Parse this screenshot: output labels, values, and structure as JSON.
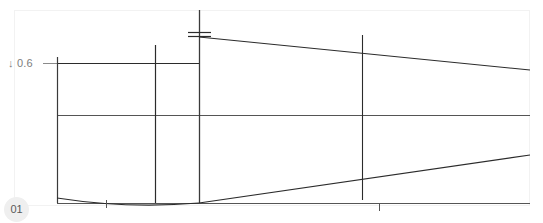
{
  "drawing": {
    "title": "Profile elevation view",
    "sheet_number": "01",
    "background_color": "#ffffff",
    "frame_color": "#f2f2f2",
    "line_color": "#2b2b2b",
    "thin_line_color": "#555555",
    "label_color": "#7d7d7d",
    "badge_color": "#efefef",
    "annotations": [
      {
        "name": "depth-dimension",
        "text": "↓ 0.6",
        "value": "0.6",
        "arrow": "down",
        "x": 8,
        "y": 57
      }
    ],
    "frame": {
      "x": 14,
      "y": 10,
      "width": 516,
      "height": 196
    },
    "geometry": {
      "baseline_y": 203,
      "mid_rail_y": 115,
      "upper_rail_y": 63,
      "left_edge_x": 57,
      "right_edge_x": 530,
      "verticals": [
        {
          "name": "station-1",
          "x": 57,
          "y1": 57,
          "y2": 203
        },
        {
          "name": "station-2",
          "x": 155,
          "y1": 45,
          "y2": 203
        },
        {
          "name": "station-3",
          "x": 199,
          "y1": 10,
          "y2": 203
        },
        {
          "name": "station-4",
          "x": 362,
          "y1": 35,
          "y2": 200
        }
      ],
      "horizontals": [
        {
          "name": "upper-rail",
          "x1": 57,
          "x2": 199,
          "y": 63
        },
        {
          "name": "mid-rail",
          "x1": 57,
          "x2": 530,
          "y": 115
        },
        {
          "name": "baseline",
          "x1": 57,
          "x2": 530,
          "y": 203
        }
      ],
      "taper_top": {
        "x1": 199,
        "y1": 37,
        "x2": 530,
        "y2": 70
      },
      "taper_bottom": {
        "x1": 199,
        "y1": 203,
        "x2": 530,
        "y2": 155
      },
      "sag_curve": {
        "x1": 57,
        "y1": 198,
        "cx": 128,
        "cy": 208,
        "x2": 199,
        "y2": 203
      },
      "leader_tick": {
        "x1": 43,
        "x2": 70,
        "y": 63
      },
      "station_ticks": [
        {
          "name": "tick-upper-a",
          "x1": 188,
          "x2": 211,
          "y": 32
        },
        {
          "name": "tick-upper-b",
          "x1": 188,
          "x2": 211,
          "y": 36
        }
      ],
      "base_ticks": [
        {
          "name": "base-tick-1",
          "x": 106,
          "y1": 200,
          "y2": 208
        },
        {
          "name": "base-tick-2",
          "x": 379,
          "y1": 203,
          "y2": 211
        }
      ]
    }
  }
}
